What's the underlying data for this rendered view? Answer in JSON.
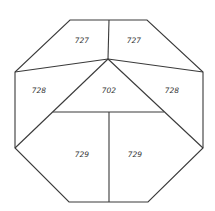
{
  "diagram": {
    "shape": "octagon",
    "line_color": "#3a3a3a",
    "regions": [
      {
        "id": "top-left",
        "label": "727"
      },
      {
        "id": "top-right",
        "label": "727"
      },
      {
        "id": "mid-left",
        "label": "728"
      },
      {
        "id": "center",
        "label": "702"
      },
      {
        "id": "mid-right",
        "label": "728"
      },
      {
        "id": "bottom-left",
        "label": "729"
      },
      {
        "id": "bottom-right",
        "label": "729"
      }
    ]
  }
}
